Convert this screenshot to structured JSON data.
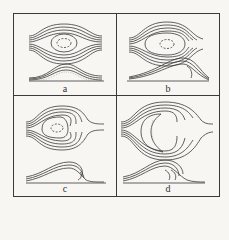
{
  "figure": {
    "panels": [
      {
        "id": "a",
        "label": "a",
        "stage": "symmetric flow around low mound"
      },
      {
        "id": "b",
        "label": "b",
        "stage": "incipient lee separation"
      },
      {
        "id": "c",
        "label": "c",
        "stage": "developed lee eddies"
      },
      {
        "id": "d",
        "label": "d",
        "stage": "strong lee vortices on steep dune"
      }
    ]
  }
}
